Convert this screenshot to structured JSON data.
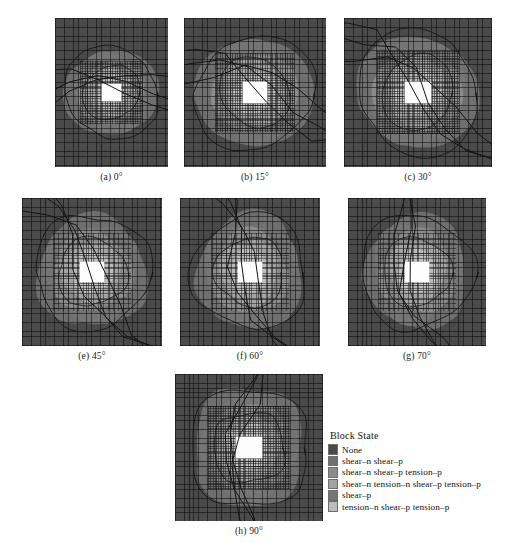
{
  "figure": {
    "title": "",
    "panels": [
      {
        "id": "a",
        "caption": "(a) 0°",
        "angle": 0,
        "x": 55,
        "y": 18,
        "w": 113,
        "h": 149
      },
      {
        "id": "b",
        "caption": "(b) 15°",
        "angle": 15,
        "x": 184,
        "y": 18,
        "w": 142,
        "h": 149
      },
      {
        "id": "c",
        "caption": "(c) 30°",
        "angle": 30,
        "x": 344,
        "y": 18,
        "w": 148,
        "h": 149
      },
      {
        "id": "e",
        "caption": "(e) 45°",
        "angle": 45,
        "x": 22,
        "y": 198,
        "w": 140,
        "h": 148
      },
      {
        "id": "f",
        "caption": "(f) 60°",
        "angle": 60,
        "x": 180,
        "y": 198,
        "w": 140,
        "h": 148
      },
      {
        "id": "g",
        "caption": "(g) 70°",
        "angle": 70,
        "x": 348,
        "y": 198,
        "w": 138,
        "h": 148
      },
      {
        "id": "h",
        "caption": "(h) 90°",
        "angle": 90,
        "x": 175,
        "y": 374,
        "w": 148,
        "h": 147
      }
    ]
  },
  "legend": {
    "title": "Block State",
    "entries": [
      {
        "label": "None",
        "color": "#4a4a4a"
      },
      {
        "label": "shear–n shear–p",
        "color": "#6f6f6f"
      },
      {
        "label": "shear–n shear–p tension–p",
        "color": "#8b8b8b"
      },
      {
        "label": "shear–n tension–n shear–p tension–p",
        "color": "#a3a3a3"
      },
      {
        "label": "shear–p",
        "color": "#757575"
      },
      {
        "label": "tension–n shear–p tension–p",
        "color": "#bcbcbc"
      }
    ]
  },
  "chart_data": {
    "type": "heatmap",
    "xlabel": "",
    "ylabel": "",
    "grid": true,
    "legend_position": "bottom-right",
    "categories": [
      "None",
      "shear-n shear-p",
      "shear-n shear-p tension-p",
      "shear-n tension-n shear-p tension-p",
      "shear-p",
      "tension-n shear-p tension-p"
    ],
    "category_colors": [
      "#4a4a4a",
      "#6f6f6f",
      "#8b8b8b",
      "#a3a3a3",
      "#757575",
      "#bcbcbc"
    ],
    "series": [
      {
        "name": "(a) 0°",
        "angle_deg": 0,
        "plastic_zone_radius_rel": 0.42,
        "zone_shape": "near-circular",
        "tunnel_shape": "rectangular"
      },
      {
        "name": "(b) 15°",
        "angle_deg": 15,
        "plastic_zone_radius_rel": 0.44,
        "zone_shape": "near-circular",
        "tunnel_shape": "rectangular"
      },
      {
        "name": "(c) 30°",
        "angle_deg": 30,
        "plastic_zone_radius_rel": 0.45,
        "zone_shape": "lobed",
        "tunnel_shape": "rectangular"
      },
      {
        "name": "(e) 45°",
        "angle_deg": 45,
        "plastic_zone_radius_rel": 0.46,
        "zone_shape": "lobed",
        "tunnel_shape": "rectangular"
      },
      {
        "name": "(f) 60°",
        "angle_deg": 60,
        "plastic_zone_radius_rel": 0.47,
        "zone_shape": "elongated",
        "tunnel_shape": "rectangular"
      },
      {
        "name": "(g) 70°",
        "angle_deg": 70,
        "plastic_zone_radius_rel": 0.47,
        "zone_shape": "elongated",
        "tunnel_shape": "rectangular"
      },
      {
        "name": "(h) 90°",
        "angle_deg": 90,
        "plastic_zone_radius_rel": 0.48,
        "zone_shape": "butterfly",
        "tunnel_shape": "rectangular"
      }
    ]
  }
}
